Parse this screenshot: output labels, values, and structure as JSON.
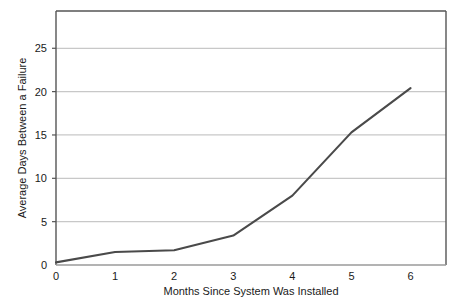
{
  "chart_data": {
    "type": "line",
    "title": "",
    "xlabel": "Months Since System Was Installed",
    "ylabel": "Average Days Between a Failure",
    "x": [
      0,
      1,
      2,
      3,
      4,
      5,
      6
    ],
    "values": [
      0.3,
      1.5,
      1.7,
      3.4,
      8.0,
      15.3,
      20.4
    ],
    "series": [
      {
        "name": "Average Days Between a Failure",
        "values": [
          0.3,
          1.5,
          1.7,
          3.4,
          8.0,
          15.3,
          20.4
        ]
      }
    ],
    "xlim": [
      0,
      6.6
    ],
    "ylim": [
      0,
      29.3
    ],
    "x_tick_labels": [
      "0",
      "1",
      "2",
      "3",
      "4",
      "5",
      "6"
    ],
    "y_tick_labels": [
      "0",
      "5",
      "10",
      "15",
      "20",
      "25"
    ],
    "y_ticks": [
      0,
      5,
      10,
      15,
      20,
      25
    ],
    "grid": "horizontal",
    "legend": "none",
    "line_color": "#4a4a4a",
    "grid_color": "#c8c8c8",
    "axis_color": "#555555",
    "background": "#ffffff"
  },
  "axes": {
    "x_title": "Months Since System Was Installed",
    "y_title": "Average Days Between a Failure"
  },
  "x_ticks": [
    {
      "label": "0",
      "value": 0
    },
    {
      "label": "1",
      "value": 1
    },
    {
      "label": "2",
      "value": 2
    },
    {
      "label": "3",
      "value": 3
    },
    {
      "label": "4",
      "value": 4
    },
    {
      "label": "5",
      "value": 5
    },
    {
      "label": "6",
      "value": 6
    }
  ],
  "y_ticks": [
    {
      "label": "25",
      "value": 25
    },
    {
      "label": "20",
      "value": 20
    },
    {
      "label": "15",
      "value": 15
    },
    {
      "label": "10",
      "value": 10
    },
    {
      "label": "5",
      "value": 5
    },
    {
      "label": "0",
      "value": 0
    }
  ]
}
